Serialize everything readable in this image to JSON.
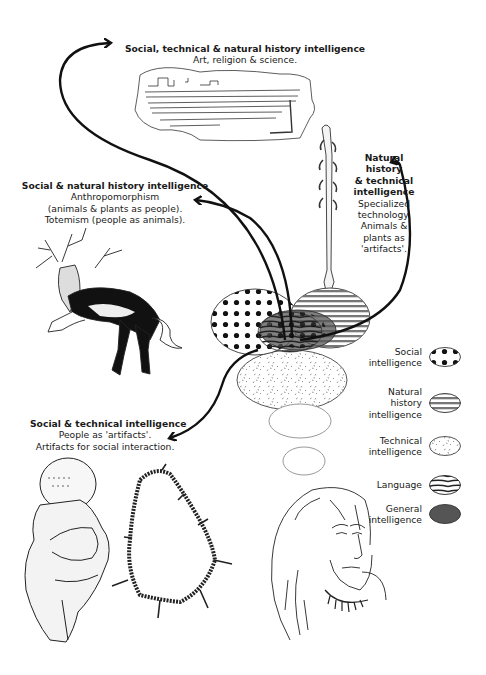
{
  "labels": {
    "top": {
      "title": "Social, technical & natural history intelligence",
      "lines": [
        "Art, religion & science."
      ]
    },
    "left_upper": {
      "title": "Social & natural history intelligence",
      "lines": [
        "Anthropomorphism",
        "(animals & plants as people).",
        "Totemism (people as animals)."
      ]
    },
    "right_upper": {
      "title_lines": [
        "Natural history",
        "& technical",
        "intelligence"
      ],
      "lines": [
        "Specialized",
        "technology.",
        "Animals &",
        "plants as",
        "'artifacts'."
      ]
    },
    "left_lower": {
      "title": "Social & technical intelligence",
      "lines": [
        "People as 'artifacts'.",
        "Artifacts for social interaction."
      ]
    }
  },
  "legend": [
    {
      "lines": [
        "Social",
        "intelligence"
      ],
      "pattern": "dots"
    },
    {
      "lines": [
        "Natural",
        "history",
        "intelligence"
      ],
      "pattern": "horizontal-stripes"
    },
    {
      "lines": [
        "Technical",
        "intelligence"
      ],
      "pattern": "speckles"
    },
    {
      "lines": [
        "Language"
      ],
      "pattern": "curved-stripes"
    },
    {
      "lines": [
        "General",
        "intelligence"
      ],
      "pattern": "solid-gray"
    }
  ],
  "colors": {
    "ink": "#1a1a1a",
    "general_fill": "#555555",
    "stripe": "#777777"
  },
  "illustrations": [
    "engraved-plaque-drawing",
    "barbed-harpoon-drawing",
    "deer-shaman-cave-painting",
    "venus-figurine-drawing",
    "tooth-bead-necklace-drawing",
    "human-face-portrait-drawing"
  ]
}
